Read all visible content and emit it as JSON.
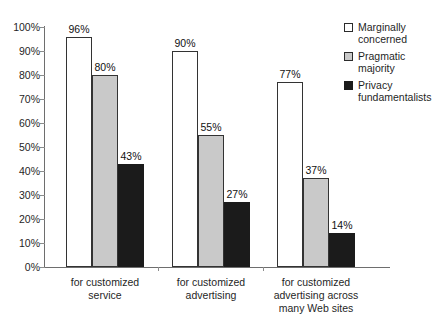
{
  "chart_data": {
    "type": "bar",
    "title": "",
    "xlabel": "",
    "ylabel": "",
    "ylim": [
      0,
      100
    ],
    "grid": false,
    "legend_position": "right",
    "categories": [
      "for customized service",
      "for customized advertising",
      "for customized advertising across many Web sites"
    ],
    "category_lines": [
      [
        "for customized",
        "service"
      ],
      [
        "for customized",
        "advertising"
      ],
      [
        "for customized",
        "advertising across",
        "many Web sites"
      ]
    ],
    "series": [
      {
        "name": "Marginally concerned",
        "name_lines": [
          "Marginally",
          "concerned"
        ],
        "color": "#ffffff",
        "values": [
          96,
          90,
          77
        ],
        "labels": [
          "96%",
          "90%",
          "77%"
        ]
      },
      {
        "name": "Pragmatic majority",
        "name_lines": [
          "Pragmatic",
          "majority"
        ],
        "color": "#c9c9c9",
        "values": [
          80,
          55,
          37
        ],
        "labels": [
          "80%",
          "55%",
          "37%"
        ]
      },
      {
        "name": "Privacy fundamentalists",
        "name_lines": [
          "Privacy",
          "fundamentalists"
        ],
        "color": "#1b1b1b",
        "values": [
          43,
          27,
          14
        ],
        "labels": [
          "43%",
          "27%",
          "14%"
        ]
      }
    ],
    "y_ticks": [
      0,
      10,
      20,
      30,
      40,
      50,
      60,
      70,
      80,
      90,
      100
    ],
    "y_tick_labels": [
      "0%",
      "10%",
      "20%",
      "30%",
      "40%",
      "50%",
      "60%",
      "70%",
      "80%",
      "90%",
      "100%"
    ]
  },
  "axis": {
    "line_color": "#6e6e6e"
  }
}
